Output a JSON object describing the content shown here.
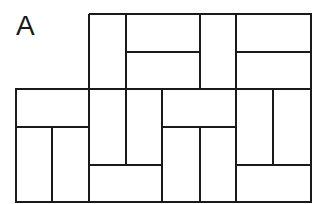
{
  "figure": {
    "label": "A",
    "stroke_color": "#1a1a1a",
    "background": "#ffffff",
    "outline": [
      [
        89,
        14
      ],
      [
        311,
        14
      ],
      [
        311,
        202
      ],
      [
        16,
        202
      ],
      [
        16,
        89
      ],
      [
        89,
        89
      ],
      [
        89,
        14
      ]
    ],
    "lines": [
      {
        "x1": 126,
        "y1": 14,
        "x2": 126,
        "y2": 165
      },
      {
        "x1": 200,
        "y1": 14,
        "x2": 200,
        "y2": 89
      },
      {
        "x1": 236,
        "y1": 14,
        "x2": 236,
        "y2": 202
      },
      {
        "x1": 126,
        "y1": 52,
        "x2": 200,
        "y2": 52
      },
      {
        "x1": 236,
        "y1": 52,
        "x2": 311,
        "y2": 52
      },
      {
        "x1": 89,
        "y1": 89,
        "x2": 311,
        "y2": 89
      },
      {
        "x1": 89,
        "y1": 89,
        "x2": 89,
        "y2": 202
      },
      {
        "x1": 162,
        "y1": 89,
        "x2": 162,
        "y2": 202
      },
      {
        "x1": 16,
        "y1": 127,
        "x2": 89,
        "y2": 127
      },
      {
        "x1": 52,
        "y1": 127,
        "x2": 52,
        "y2": 202
      },
      {
        "x1": 89,
        "y1": 165,
        "x2": 162,
        "y2": 165
      },
      {
        "x1": 162,
        "y1": 127,
        "x2": 236,
        "y2": 127
      },
      {
        "x1": 200,
        "y1": 127,
        "x2": 200,
        "y2": 202
      },
      {
        "x1": 273,
        "y1": 89,
        "x2": 273,
        "y2": 165
      },
      {
        "x1": 236,
        "y1": 165,
        "x2": 311,
        "y2": 165
      }
    ]
  }
}
